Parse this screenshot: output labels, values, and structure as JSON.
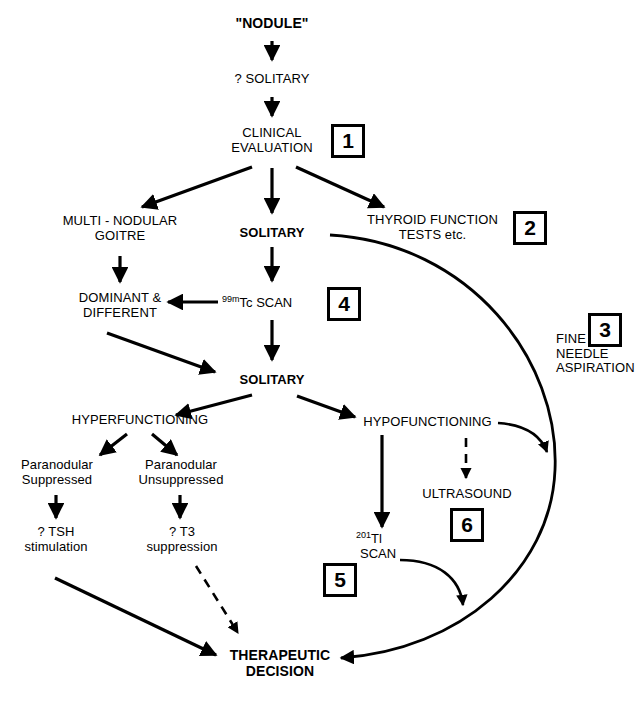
{
  "diagram": {
    "type": "flowchart",
    "background_color": "#ffffff",
    "line_color": "#000000"
  },
  "nodes": {
    "nodule": "\"NODULE\"",
    "question_solitary": "? SOLITARY",
    "clinical_evaluation": "CLINICAL\nEVALUATION",
    "multinodular_goitre": "MULTI - NODULAR\nGOITRE",
    "solitary_1": "SOLITARY",
    "thyroid_function_tests": "THYROID FUNCTION\nTESTS etc.",
    "dominant_different": "DOMINANT &\nDIFFERENT",
    "tc_scan_sup": "99m",
    "tc_scan_main": "Tc SCAN",
    "fine_needle_aspiration": "FINE\nNEEDLE\nASPIRATION",
    "solitary_2": "SOLITARY",
    "hyperfunctioning": "HYPERFUNCTIONING",
    "hypofunctioning": "HYPOFUNCTIONING",
    "paranodular_suppressed": "Paranodular\nSuppressed",
    "paranodular_unsuppressed": "Paranodular\nUnsuppressed",
    "ultrasound": "ULTRASOUND",
    "tsh_stimulation": "? TSH\nstimulation",
    "t3_suppression": "? T3\nsuppression",
    "tl_scan_sup": "201",
    "tl_scan_main": "Tl",
    "tl_scan_second": "SCAN",
    "therapeutic_decision": "THERAPEUTIC\nDECISION"
  },
  "step_boxes": [
    {
      "id": "box-1",
      "label": "1"
    },
    {
      "id": "box-2",
      "label": "2"
    },
    {
      "id": "box-3",
      "label": "3"
    },
    {
      "id": "box-4",
      "label": "4"
    },
    {
      "id": "box-5",
      "label": "5"
    },
    {
      "id": "box-6",
      "label": "6"
    }
  ]
}
